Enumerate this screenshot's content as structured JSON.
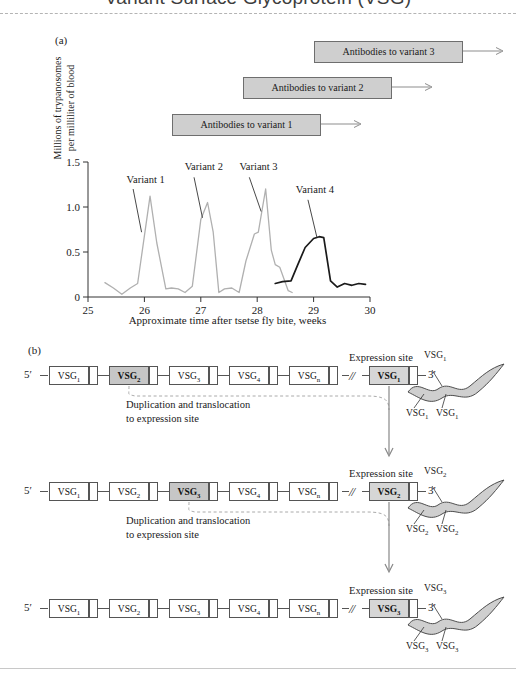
{
  "title": "Variant Surface Glycoprotein (VSG)",
  "panels": {
    "a_letter": "(a)",
    "b_letter": "(b)"
  },
  "antibodies": [
    {
      "label": "Antibodies to variant 1"
    },
    {
      "label": "Antibodies to variant 2"
    },
    {
      "label": "Antibodies to variant 3"
    }
  ],
  "chart_data": {
    "type": "line",
    "title": "",
    "xlabel": "Approximate time after tsetse fly bite, weeks",
    "ylabel": "Millions of trypanosomes per milliliter of blood",
    "ylabel_line1": "Millions of trypanosomes",
    "ylabel_line2": "per milliliter of blood",
    "xlim": [
      25,
      30
    ],
    "ylim": [
      0,
      1.5
    ],
    "xticks": [
      25,
      26,
      27,
      28,
      29,
      30
    ],
    "xticklabels": [
      "25",
      "26",
      "27",
      "28",
      "29",
      "30"
    ],
    "yticks": [
      0,
      0.5,
      1.0,
      1.5
    ],
    "yticklabels": [
      "0",
      "0.5",
      "1.0",
      "1.5"
    ],
    "grid": false,
    "legend": "none",
    "annotations": [
      {
        "text": "Variant 1",
        "x": 25.72,
        "y": 1.28
      },
      {
        "text": "Variant 2",
        "x": 26.75,
        "y": 1.42
      },
      {
        "text": "Variant 3",
        "x": 27.72,
        "y": 1.42
      },
      {
        "text": "Variant 4",
        "x": 28.72,
        "y": 1.17
      }
    ],
    "series": [
      {
        "name": "Parasitemia (variants 1-3)",
        "color": "#b0b0b0",
        "x": [
          25.3,
          25.45,
          25.6,
          25.75,
          25.88,
          26.1,
          26.22,
          26.38,
          26.48,
          26.6,
          26.72,
          26.85,
          27.0,
          27.12,
          27.22,
          27.32,
          27.42,
          27.55,
          27.68,
          27.8,
          27.95,
          28.02,
          28.15,
          28.25,
          28.32,
          28.4,
          28.55,
          28.62
        ],
        "y": [
          0.16,
          0.1,
          0.03,
          0.1,
          0.15,
          1.12,
          0.6,
          0.09,
          0.1,
          0.09,
          0.05,
          0.12,
          0.86,
          1.05,
          0.72,
          0.05,
          0.09,
          0.1,
          0.05,
          0.4,
          0.7,
          0.72,
          1.2,
          0.52,
          0.36,
          0.33,
          0.07,
          0.05
        ]
      },
      {
        "name": "Variant 4",
        "color": "#1a1a1a",
        "x": [
          28.32,
          28.45,
          28.6,
          28.72,
          28.85,
          29.0,
          29.1,
          29.18,
          29.3,
          29.42,
          29.55,
          29.68,
          29.8,
          29.92
        ],
        "y": [
          0.15,
          0.17,
          0.18,
          0.36,
          0.55,
          0.65,
          0.67,
          0.66,
          0.18,
          0.11,
          0.15,
          0.13,
          0.15,
          0.14
        ]
      }
    ]
  },
  "gene_rows": [
    {
      "five_prime": "5′",
      "three_prime": "3′",
      "expression_site_label": "Expression site",
      "break_symbol": "//",
      "genes": [
        {
          "label": "VSG",
          "sub": "1",
          "state": "plain"
        },
        {
          "label": "VSG",
          "sub": "2",
          "state": "shaded"
        },
        {
          "label": "VSG",
          "sub": "3",
          "state": "plain"
        },
        {
          "label": "VSG",
          "sub": "4",
          "state": "plain"
        },
        {
          "label": "VSG",
          "sub": "n",
          "state": "plain"
        }
      ],
      "expression_gene": {
        "label": "VSG",
        "sub": "1",
        "state": "exp"
      },
      "process_text_line1": "Duplication and translocation",
      "process_text_line2": "to expression site",
      "trypanosome_labels": [
        {
          "text": "VSG",
          "sub": "1"
        },
        {
          "text": "VSG",
          "sub": "1"
        },
        {
          "text": "VSG",
          "sub": "1"
        }
      ]
    },
    {
      "five_prime": "5′",
      "three_prime": "3′",
      "expression_site_label": "Expression site",
      "break_symbol": "//",
      "genes": [
        {
          "label": "VSG",
          "sub": "1",
          "state": "plain"
        },
        {
          "label": "VSG",
          "sub": "2",
          "state": "plain"
        },
        {
          "label": "VSG",
          "sub": "3",
          "state": "shaded"
        },
        {
          "label": "VSG",
          "sub": "4",
          "state": "plain"
        },
        {
          "label": "VSG",
          "sub": "n",
          "state": "plain"
        }
      ],
      "expression_gene": {
        "label": "VSG",
        "sub": "2",
        "state": "exp"
      },
      "process_text_line1": "Duplication and translocation",
      "process_text_line2": "to expression site",
      "trypanosome_labels": [
        {
          "text": "VSG",
          "sub": "2"
        },
        {
          "text": "VSG",
          "sub": "2"
        },
        {
          "text": "VSG",
          "sub": "2"
        }
      ]
    },
    {
      "five_prime": "5′",
      "three_prime": "3′",
      "expression_site_label": "Expression site",
      "break_symbol": "//",
      "genes": [
        {
          "label": "VSG",
          "sub": "1",
          "state": "plain"
        },
        {
          "label": "VSG",
          "sub": "2",
          "state": "plain"
        },
        {
          "label": "VSG",
          "sub": "3",
          "state": "plain"
        },
        {
          "label": "VSG",
          "sub": "4",
          "state": "plain"
        },
        {
          "label": "VSG",
          "sub": "n",
          "state": "plain"
        }
      ],
      "expression_gene": {
        "label": "VSG",
        "sub": "3",
        "state": "exp"
      },
      "process_text_line1": "",
      "process_text_line2": "",
      "trypanosome_labels": [
        {
          "text": "VSG",
          "sub": "3"
        },
        {
          "text": "VSG",
          "sub": "3"
        },
        {
          "text": "VSG",
          "sub": "3"
        }
      ]
    }
  ],
  "colors": {
    "box_shaded": "#c6c6c6",
    "box_expression": "#d6d6d6",
    "antibody_box": "#cfcfcf",
    "curve_gray": "#b0b0b0",
    "curve_black": "#1a1a1a",
    "outline": "#555555"
  }
}
